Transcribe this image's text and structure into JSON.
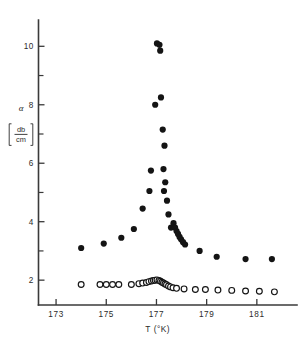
{
  "figure": {
    "background_color": "#ffffff",
    "ink_color": "#141414",
    "axis_color": "#3a3a3a"
  },
  "axis_labels": {
    "y_symbol": "α",
    "y_unit_numerator": "db",
    "y_unit_denominator": "cm",
    "x_title": "T  (°K)"
  },
  "chart_data": {
    "type": "scatter",
    "title": "",
    "xlabel": "T  (°K)",
    "ylabel": "α [db/cm]",
    "xlim": [
      172.3,
      182.6
    ],
    "ylim": [
      1.15,
      10.9
    ],
    "grid": false,
    "legend": "none",
    "x_ticks": [
      173,
      175,
      177,
      179,
      181
    ],
    "x_tick_labels": [
      "173",
      "175",
      "177",
      "179",
      "181"
    ],
    "y_ticks": [
      2,
      4,
      6,
      8,
      10
    ],
    "y_tick_labels": [
      "2",
      "4",
      "6",
      "8",
      "10"
    ],
    "y_minor_ticks": [
      3,
      5,
      7,
      9
    ],
    "series": [
      {
        "name": "filled-circles",
        "marker": "filled-circle",
        "marker_radius_px": 3.1,
        "color": "#141414",
        "points": [
          [
            174.0,
            3.1
          ],
          [
            174.9,
            3.25
          ],
          [
            175.6,
            3.45
          ],
          [
            176.1,
            3.75
          ],
          [
            176.45,
            4.45
          ],
          [
            176.72,
            5.05
          ],
          [
            176.78,
            5.75
          ],
          [
            176.95,
            8.0
          ],
          [
            177.02,
            10.1
          ],
          [
            177.12,
            10.05
          ],
          [
            177.15,
            9.85
          ],
          [
            177.18,
            8.25
          ],
          [
            177.25,
            7.15
          ],
          [
            177.32,
            6.6
          ],
          [
            177.28,
            5.8
          ],
          [
            177.35,
            5.35
          ],
          [
            177.3,
            5.05
          ],
          [
            177.42,
            4.72
          ],
          [
            177.48,
            4.25
          ],
          [
            177.58,
            3.8
          ],
          [
            177.68,
            3.95
          ],
          [
            177.74,
            3.8
          ],
          [
            177.8,
            3.68
          ],
          [
            177.86,
            3.58
          ],
          [
            177.92,
            3.48
          ],
          [
            177.98,
            3.4
          ],
          [
            178.06,
            3.3
          ],
          [
            178.14,
            3.22
          ],
          [
            178.72,
            3.0
          ],
          [
            179.4,
            2.8
          ],
          [
            180.55,
            2.72
          ],
          [
            181.6,
            2.72
          ]
        ]
      },
      {
        "name": "open-circles",
        "marker": "open-circle",
        "marker_radius_px": 2.9,
        "color": "#141414",
        "points": [
          [
            174.0,
            1.85
          ],
          [
            174.75,
            1.85
          ],
          [
            175.0,
            1.85
          ],
          [
            175.25,
            1.85
          ],
          [
            175.5,
            1.85
          ],
          [
            176.0,
            1.85
          ],
          [
            176.3,
            1.88
          ],
          [
            176.45,
            1.9
          ],
          [
            176.6,
            1.92
          ],
          [
            176.7,
            1.95
          ],
          [
            176.8,
            1.97
          ],
          [
            176.88,
            1.99
          ],
          [
            176.95,
            2.0
          ],
          [
            177.02,
            2.01
          ],
          [
            177.1,
            1.99
          ],
          [
            177.16,
            1.96
          ],
          [
            177.22,
            1.93
          ],
          [
            177.28,
            1.9
          ],
          [
            177.34,
            1.87
          ],
          [
            177.4,
            1.84
          ],
          [
            177.48,
            1.8
          ],
          [
            177.56,
            1.77
          ],
          [
            177.66,
            1.74
          ],
          [
            177.8,
            1.72
          ],
          [
            178.1,
            1.7
          ],
          [
            178.55,
            1.68
          ],
          [
            178.95,
            1.68
          ],
          [
            179.45,
            1.66
          ],
          [
            180.0,
            1.65
          ],
          [
            180.55,
            1.63
          ],
          [
            181.1,
            1.62
          ],
          [
            181.7,
            1.6
          ]
        ]
      }
    ]
  }
}
